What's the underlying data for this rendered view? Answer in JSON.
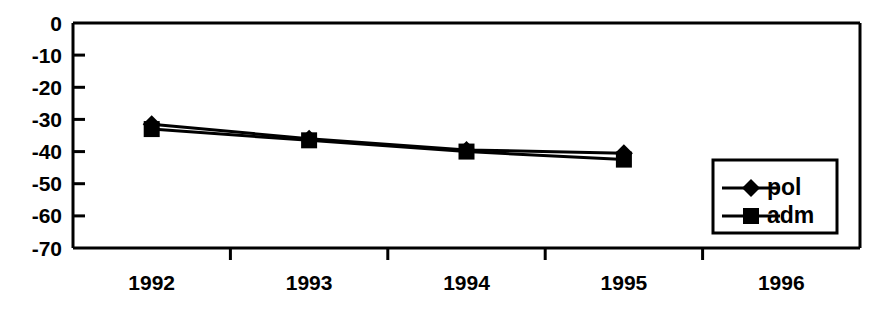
{
  "chart_data": {
    "type": "line",
    "title": "",
    "xlabel": "",
    "ylabel": "",
    "categories": [
      "1992",
      "1993",
      "1994",
      "1995",
      "1996"
    ],
    "y_ticks": [
      "0",
      "-10",
      "-20",
      "-30",
      "-40",
      "-50",
      "-60",
      "-70"
    ],
    "ylim": [
      -70,
      0
    ],
    "grid": false,
    "legend_position": "bottom-right",
    "series": [
      {
        "name": "pol",
        "marker": "diamond",
        "color": "#000000",
        "values": [
          -31.5,
          -36.0,
          -39.5,
          -40.5,
          null
        ]
      },
      {
        "name": "adm",
        "marker": "square",
        "color": "#000000",
        "values": [
          -33.0,
          -36.5,
          -40.0,
          -42.5,
          null
        ]
      }
    ]
  },
  "legend": {
    "entries": [
      {
        "label": "pol",
        "marker": "diamond-marker-icon"
      },
      {
        "label": "adm",
        "marker": "square-marker-icon"
      }
    ]
  },
  "axes": {
    "y_axis_name": "y-axis",
    "x_axis_name": "x-axis"
  }
}
